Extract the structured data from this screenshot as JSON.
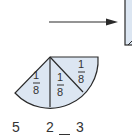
{
  "diagram": {
    "arrow": {
      "direction": "right"
    },
    "sectors": [
      {
        "label_num": "1",
        "label_den": "8"
      },
      {
        "label_num": "1",
        "label_den": "8"
      },
      {
        "label_num": "1",
        "label_den": "8"
      }
    ],
    "bottom_labels": [
      "5",
      "2",
      "3"
    ],
    "colors": {
      "fill": "#dce6f2",
      "stroke": "#2a2a2a"
    }
  }
}
